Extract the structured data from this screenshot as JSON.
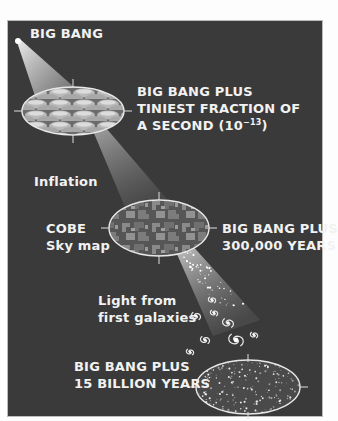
{
  "labels": {
    "big_bang": "BIG BANG",
    "stage1_line1": "BIG BANG PLUS",
    "stage1_line2": "TINIEST FRACTION OF",
    "stage1_line3_prefix": "A SECOND (10",
    "stage1_exponent": "−13",
    "stage1_line3_suffix": ")",
    "inflation": "Inflation",
    "cobe_line1": "COBE",
    "cobe_line2": "Sky map",
    "stage2_line1": "BIG BANG PLUS",
    "stage2_line2": "300,000 YEARS",
    "light_line1": "Light from",
    "light_line2": "first galaxies",
    "stage3_line1": "BIG BANG PLUS",
    "stage3_line2": "15 BILLION YEARS"
  },
  "colors": {
    "background": "#3a3a3a",
    "text": "#f2f2f2",
    "outline": "#e8e8e8"
  }
}
